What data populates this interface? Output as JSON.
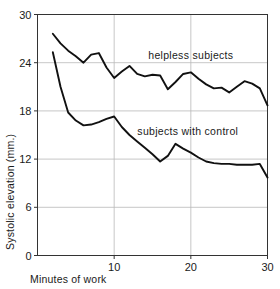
{
  "chart_data": {
    "type": "line",
    "title": "",
    "xlabel": "Minutes of work",
    "ylabel": "Systolic elevation  (mm.)",
    "xlim": [
      0,
      30
    ],
    "ylim": [
      0,
      30
    ],
    "xticks": [
      10,
      20,
      30
    ],
    "yticks": [
      0,
      6,
      12,
      18,
      24,
      30
    ],
    "xtick_labels": [
      "10",
      "20",
      "30"
    ],
    "ytick_labels": [
      "0",
      "6",
      "12",
      "18",
      "24",
      "30"
    ],
    "grid": true,
    "legend_position": "inline-annotations",
    "line_color": "#111111",
    "grid_color": "#b9b9b9",
    "axis_color": "#333333",
    "background_color": "#ffffff",
    "series": [
      {
        "name": "helpless subjects",
        "label_x": 20.0,
        "label_y": 24.4,
        "x": [
          2,
          3,
          4,
          5,
          6,
          7,
          8,
          9,
          10,
          11,
          12,
          13,
          14,
          15,
          16,
          17,
          18,
          19,
          20,
          21,
          22,
          23,
          24,
          25,
          26,
          27,
          28,
          29,
          30
        ],
        "values": [
          27.6,
          26.4,
          25.5,
          24.8,
          24.0,
          25.0,
          25.2,
          23.4,
          22.1,
          22.9,
          23.6,
          22.6,
          22.3,
          22.5,
          22.4,
          20.7,
          21.6,
          22.6,
          22.8,
          22.0,
          21.3,
          20.8,
          20.9,
          20.3,
          21.0,
          21.7,
          21.4,
          20.8,
          18.7
        ]
      },
      {
        "name": "subjects with control",
        "label_x": 19.6,
        "label_y": 15.0,
        "x": [
          2,
          3,
          4,
          5,
          6,
          7,
          8,
          9,
          10,
          11,
          12,
          13,
          14,
          15,
          16,
          17,
          18,
          19,
          20,
          21,
          22,
          23,
          24,
          25,
          26,
          27,
          28,
          29,
          30
        ],
        "values": [
          25.3,
          21.0,
          17.8,
          16.8,
          16.2,
          16.3,
          16.6,
          17.0,
          17.3,
          16.0,
          15.0,
          14.2,
          13.4,
          12.6,
          11.7,
          12.4,
          13.9,
          13.3,
          12.8,
          12.2,
          11.7,
          11.5,
          11.4,
          11.4,
          11.3,
          11.3,
          11.3,
          11.4,
          9.7
        ]
      }
    ]
  }
}
